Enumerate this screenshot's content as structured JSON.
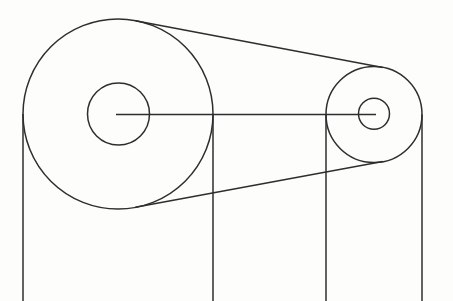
{
  "diagram": {
    "name": "belt-and-pulley-drive-line-drawing",
    "canvas": {
      "width": 453,
      "height": 301,
      "background": "#fdfdfc"
    },
    "style": {
      "stroke_color": "#2e2e2e",
      "stroke_width": 1.5,
      "fill": "none"
    },
    "circles": [
      {
        "name": "large-pulley-rim",
        "cx": 118,
        "cy": 114,
        "r": 95
      },
      {
        "name": "large-pulley-hub",
        "cx": 118.5,
        "cy": 114,
        "r": 31
      },
      {
        "name": "small-pulley-rim",
        "cx": 374,
        "cy": 114.5,
        "r": 48
      },
      {
        "name": "small-pulley-hub",
        "cx": 374,
        "cy": 113.8,
        "r": 15.5
      }
    ],
    "lines": [
      {
        "name": "center-axis-line",
        "x1": 116,
        "y1": 114.5,
        "x2": 376,
        "y2": 114.5
      },
      {
        "name": "belt-upper-run",
        "x1": 135.4,
        "y1": 20.7,
        "x2": 382.8,
        "y2": 67.6
      },
      {
        "name": "belt-lower-run",
        "x1": 135.4,
        "y1": 207.3,
        "x2": 382.8,
        "y2": 161.4
      },
      {
        "name": "large-pulley-left-vertical",
        "x1": 23,
        "y1": 114,
        "x2": 23,
        "y2": 301
      },
      {
        "name": "large-pulley-right-vertical",
        "x1": 213,
        "y1": 114,
        "x2": 213,
        "y2": 301
      },
      {
        "name": "small-pulley-left-vertical",
        "x1": 326,
        "y1": 114.5,
        "x2": 326,
        "y2": 301
      },
      {
        "name": "small-pulley-right-vertical",
        "x1": 422,
        "y1": 114.5,
        "x2": 422,
        "y2": 301
      }
    ]
  }
}
